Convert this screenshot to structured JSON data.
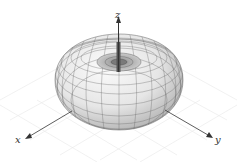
{
  "figure": {
    "axes": {
      "x": {
        "label": "x"
      },
      "y": {
        "label": "y"
      },
      "z": {
        "label": "z"
      }
    },
    "colors": {
      "surface_light": "#f4f4f4",
      "surface_dark": "#9a9a9a",
      "mesh": "#555555",
      "axis": "#333333",
      "grid": "#e6e6e6"
    }
  }
}
